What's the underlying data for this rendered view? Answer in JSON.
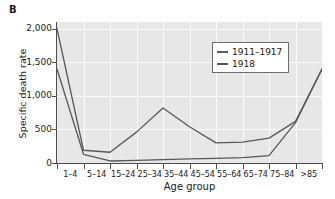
{
  "panel": {
    "label": "B"
  },
  "axes": {
    "ylabel": "Specific death rate",
    "xlabel": "Age group",
    "yticks": [
      "0",
      "500",
      "1,000",
      "1,500",
      "2,000"
    ],
    "xticks": [
      "1–4",
      "5–14",
      "15–24",
      "25–34",
      "35–44",
      "45–54",
      "55–64",
      "65–74",
      "75–84",
      ">85"
    ]
  },
  "legend": {
    "position": "inside-upper-center",
    "entries": [
      {
        "label": "1911–1917",
        "color": "#585858"
      },
      {
        "label": "1918",
        "color": "#585858"
      }
    ]
  },
  "colors": {
    "line": "#585858",
    "plot_background": "#e7e7e7",
    "gridline": "#fbfbfb",
    "axis": "#4d4d4d",
    "text": "#1a1a1a"
  },
  "chart_data": {
    "type": "line",
    "title": "",
    "subtitle": "",
    "xlabel": "Age group",
    "ylabel": "Specific death rate",
    "categories": [
      "1–4",
      "5–14",
      "15–24",
      "25–34",
      "35–44",
      "45–54",
      "55–64",
      "65–74",
      "75–84",
      ">85"
    ],
    "ylim": [
      0,
      2100
    ],
    "yticks": [
      0,
      500,
      1000,
      1500,
      2000
    ],
    "grid": true,
    "legend_position": "upper center inside axes",
    "note": "Leftmost plotted point lies on the y-axis (left spine), before the 1-4 label; categories are plotted at tick boundaries so the first vertex sits at x=0.",
    "series": [
      {
        "name": "1911–1917",
        "color": "#585858",
        "x": [
          "<1",
          "1–4",
          "5–14",
          "15–24",
          "25–34",
          "35–44",
          "45–54",
          "55–64",
          "65–74",
          "75–84",
          ">85"
        ],
        "values": [
          1400,
          130,
          30,
          40,
          50,
          60,
          70,
          80,
          110,
          600,
          1400
        ]
      },
      {
        "name": "1918",
        "color": "#585858",
        "x": [
          "<1",
          "1–4",
          "5–14",
          "15–24",
          "25–34",
          "35–44",
          "45–54",
          "55–64",
          "65–74",
          "75–84",
          ">85"
        ],
        "values": [
          2000,
          190,
          160,
          460,
          820,
          540,
          300,
          310,
          370,
          620,
          1400
        ]
      }
    ]
  }
}
